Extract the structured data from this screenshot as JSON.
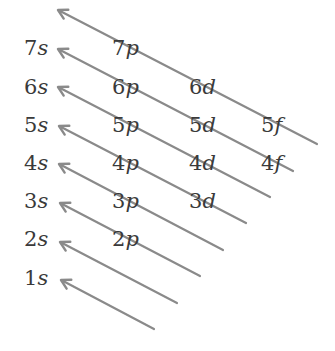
{
  "colors": {
    "arrow": "#8a8a8a",
    "text": "#3a3a3a",
    "background": "#ffffff"
  },
  "labels": [
    {
      "n": "7",
      "l": "s",
      "x": 24,
      "y": 38
    },
    {
      "n": "7",
      "l": "p",
      "x": 112,
      "y": 38
    },
    {
      "n": "6",
      "l": "s",
      "x": 24,
      "y": 77
    },
    {
      "n": "6",
      "l": "p",
      "x": 112,
      "y": 77
    },
    {
      "n": "6",
      "l": "d",
      "x": 189,
      "y": 77
    },
    {
      "n": "5",
      "l": "s",
      "x": 24,
      "y": 115
    },
    {
      "n": "5",
      "l": "p",
      "x": 112,
      "y": 115
    },
    {
      "n": "5",
      "l": "d",
      "x": 189,
      "y": 115
    },
    {
      "n": "5",
      "l": "f",
      "x": 261,
      "y": 115
    },
    {
      "n": "4",
      "l": "s",
      "x": 24,
      "y": 153
    },
    {
      "n": "4",
      "l": "p",
      "x": 112,
      "y": 153
    },
    {
      "n": "4",
      "l": "d",
      "x": 189,
      "y": 153
    },
    {
      "n": "4",
      "l": "f",
      "x": 261,
      "y": 153
    },
    {
      "n": "3",
      "l": "s",
      "x": 24,
      "y": 191
    },
    {
      "n": "3",
      "l": "p",
      "x": 112,
      "y": 191
    },
    {
      "n": "3",
      "l": "d",
      "x": 189,
      "y": 191
    },
    {
      "n": "2",
      "l": "s",
      "x": 24,
      "y": 229
    },
    {
      "n": "2",
      "l": "p",
      "x": 112,
      "y": 229
    },
    {
      "n": "1",
      "l": "s",
      "x": 24,
      "y": 268
    }
  ],
  "arrows": [
    {
      "x1": 317,
      "y1": 144,
      "x2": 58,
      "y2": 10
    },
    {
      "x1": 293,
      "y1": 171,
      "x2": 58,
      "y2": 49
    },
    {
      "x1": 270,
      "y1": 197,
      "x2": 58,
      "y2": 87
    },
    {
      "x1": 246,
      "y1": 223,
      "x2": 59,
      "y2": 126
    },
    {
      "x1": 223,
      "y1": 250,
      "x2": 59,
      "y2": 164
    },
    {
      "x1": 200,
      "y1": 276,
      "x2": 60,
      "y2": 203
    },
    {
      "x1": 177,
      "y1": 303,
      "x2": 60,
      "y2": 242
    },
    {
      "x1": 154,
      "y1": 329,
      "x2": 61,
      "y2": 280
    }
  ]
}
